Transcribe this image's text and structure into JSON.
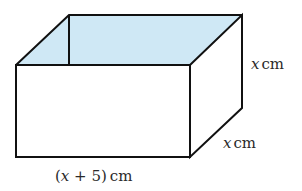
{
  "diagram": {
    "type": "open-box-cuboid",
    "colors": {
      "stroke": "#111111",
      "inner_fill": "#cfe8f5",
      "face_fill": "#ffffff"
    },
    "labels": {
      "height": {
        "var": "x",
        "unit": "cm"
      },
      "depth": {
        "var": "x",
        "unit": "cm"
      },
      "length": {
        "open": "(",
        "var": "x",
        "rest": " + 5)",
        "unit": "cm"
      }
    }
  }
}
